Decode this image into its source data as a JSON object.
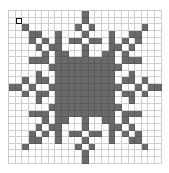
{
  "puzzle": {
    "rows": 23,
    "cols": 23,
    "selected_cell": [
      1,
      1
    ],
    "colors": {
      "filled": "#6a6a6a",
      "empty": "#ffffff",
      "grid_line": "#cfcfcf",
      "selection": "#111111"
    },
    "filled_top_left_quadrant": [
      [
        0,
        [
          11
        ]
      ],
      [
        1,
        [
          11
        ]
      ],
      [
        2,
        [
          2,
          10
        ]
      ],
      [
        3,
        [
          3,
          4,
          7,
          11
        ]
      ],
      [
        4,
        [
          3,
          5,
          7,
          9,
          10
        ]
      ],
      [
        5,
        [
          4,
          6,
          7,
          11
        ]
      ],
      [
        6,
        [
          5,
          7,
          8,
          11
        ]
      ],
      [
        7,
        [
          3,
          4,
          5,
          7,
          8,
          9,
          10,
          11
        ]
      ],
      [
        8,
        [
          6,
          7,
          8,
          9,
          10,
          11
        ]
      ],
      [
        9,
        [
          4,
          7,
          8,
          9,
          10,
          11
        ]
      ],
      [
        10,
        [
          2,
          4,
          5,
          7,
          8,
          9,
          10,
          11
        ]
      ],
      [
        11,
        [
          0,
          1,
          3,
          6,
          7,
          8,
          9,
          10,
          11
        ]
      ]
    ],
    "symmetry": "mirror-horizontal-and-vertical"
  }
}
